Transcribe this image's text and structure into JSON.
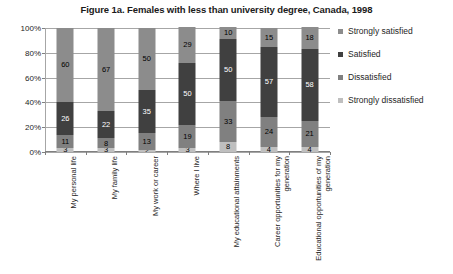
{
  "chart_data": {
    "type": "bar",
    "subtype": "stacked-bar-100-percent",
    "title": "Figure 1a. Females with less than university degree, Canada, 1998",
    "xlabel": "",
    "ylabel": "",
    "ylim": [
      0,
      100
    ],
    "yticks": [
      "0%",
      "20%",
      "40%",
      "60%",
      "80%",
      "100%"
    ],
    "ytick_values": [
      0,
      20,
      40,
      60,
      80,
      100
    ],
    "grid": true,
    "legend_position": "right",
    "stack_order_bottom_to_top": [
      "Strongly dissatisfied",
      "Dissatisfied",
      "Satisfied",
      "Strongly satisfied"
    ],
    "categories": [
      "My personal life",
      "My family life",
      "My work or career",
      "Where I live",
      "My educational attainments",
      "Career opportunities for my generation",
      "Educational opportunities of my generation"
    ],
    "series": [
      {
        "name": "Strongly dissatisfied",
        "color": "#bfbfbf",
        "values": [
          3,
          3,
          2,
          3,
          8,
          4,
          4
        ]
      },
      {
        "name": "Dissatisfied",
        "color": "#808080",
        "values": [
          11,
          8,
          13,
          19,
          33,
          24,
          21
        ]
      },
      {
        "name": "Satisfied",
        "color": "#404040",
        "values": [
          26,
          22,
          35,
          50,
          50,
          57,
          58
        ]
      },
      {
        "name": "Strongly satisfied",
        "color": "#8c8c8c",
        "values": [
          60,
          67,
          50,
          29,
          10,
          15,
          18
        ]
      }
    ]
  },
  "legend": {
    "items": [
      {
        "label": "Strongly satisfied",
        "color": "#8c8c8c"
      },
      {
        "label": "Satisfied",
        "color": "#404040"
      },
      {
        "label": "Dissatisfied",
        "color": "#808080"
      },
      {
        "label": "Strongly dissatisfied",
        "color": "#bfbfbf"
      }
    ]
  }
}
